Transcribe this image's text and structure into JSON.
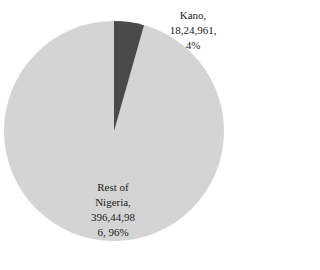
{
  "chart_data": {
    "type": "pie",
    "title": "",
    "categories": [
      "Kano",
      "Rest of Nigeria"
    ],
    "values": [
      1824961,
      39644986
    ],
    "value_labels": [
      "18,24,961",
      "396,44,986"
    ],
    "percentages": [
      4,
      96
    ],
    "colors": [
      "#4a4a4a",
      "#d4d4d4"
    ],
    "legend": "none",
    "start_angle_deg": 0
  },
  "labels": {
    "kano": {
      "line1": "Kano,",
      "line2": "18,24,961,",
      "line3": "4%"
    },
    "rest": {
      "line1": "Rest of",
      "line2": "Nigeria,",
      "line3": "396,44,98",
      "line4": "6, 96%"
    }
  }
}
